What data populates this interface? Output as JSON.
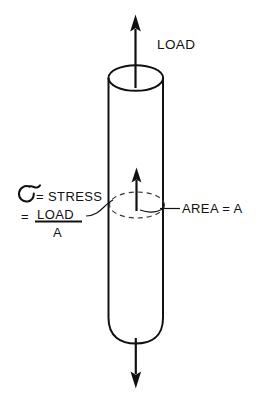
{
  "figure": {
    "background_color": "#ffffff",
    "ink_color": "#111111",
    "dash_color": "#3a3a3a",
    "width": 257,
    "height": 401
  },
  "labels": {
    "load_top": "LOAD",
    "stress_symbol": "σ",
    "stress_definition": "= STRESS",
    "equals": "=",
    "fraction_numerator": "LOAD",
    "fraction_denominator": "A",
    "area": "AREA = A"
  },
  "annotations": {
    "top_arrow": "load-arrow-up",
    "bottom_arrow": "load-arrow-down",
    "internal_arrow": "internal-force-arrow",
    "cross_section": "dashed-cross-section-ellipse",
    "leader_stress": "leader-line-stress",
    "leader_area": "leader-line-area"
  },
  "geometry": {
    "cylinder_left_x": 108,
    "cylinder_right_x": 163,
    "cylinder_top_y": 78,
    "cylinder_bottom_y": 330,
    "cap_ellipse_ry": 13,
    "cross_section_center_y": 205
  }
}
